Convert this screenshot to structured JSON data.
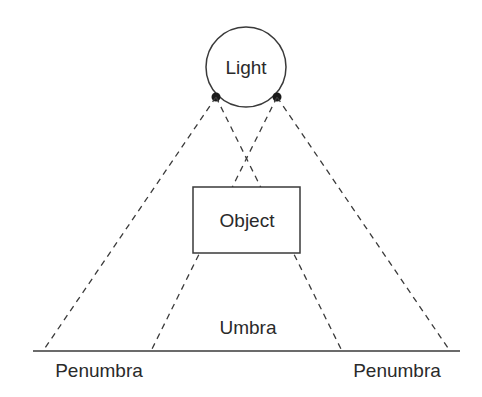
{
  "diagram": {
    "labels": {
      "light": "Light",
      "object": "Object",
      "umbra": "Umbra",
      "penumbra_left": "Penumbra",
      "penumbra_right": "Penumbra"
    },
    "colors": {
      "stroke": "#3a3a3a",
      "text": "#2a2a2a",
      "background": "#ffffff"
    },
    "elements": {
      "light_source": {
        "shape": "circle",
        "cx": 246,
        "cy": 67,
        "r": 40
      },
      "light_edge_points": [
        {
          "x": 216,
          "y": 97
        },
        {
          "x": 277,
          "y": 97
        }
      ],
      "object_box": {
        "x": 193,
        "y": 187,
        "width": 107,
        "height": 66
      },
      "ground_line": {
        "x1": 33,
        "x2": 460,
        "y": 351
      },
      "rays": [
        {
          "from": "left-edge",
          "to_ground_x": 43,
          "type": "outer-penumbra-boundary"
        },
        {
          "from": "left-edge",
          "to_ground_x": 342,
          "type": "umbra-boundary"
        },
        {
          "from": "right-edge",
          "to_ground_x": 151,
          "type": "umbra-boundary"
        },
        {
          "from": "right-edge",
          "to_ground_x": 450,
          "type": "outer-penumbra-boundary"
        }
      ]
    }
  }
}
